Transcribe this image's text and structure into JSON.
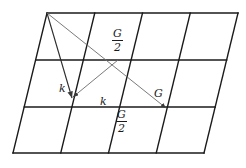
{
  "figure": {
    "background_color": "#ffffff",
    "width": 246,
    "height": 168
  },
  "lattice": {
    "description": "4 by 3 oblique lattice drawn as a large parallelogram subdivided by grid lines",
    "columns": 4,
    "rows": 3,
    "line_color": "#1a1a1a",
    "line_width": 1.4,
    "corners": {
      "top_left": [
        47,
        13
      ],
      "top_right": [
        238,
        13
      ],
      "bottom_right": [
        204,
        153
      ],
      "bottom_left": [
        13,
        153
      ]
    },
    "horizontal_lines_y": [
      13,
      60,
      107,
      153
    ],
    "slant_dx_per_row": -11.33
  },
  "vectors": {
    "color": "#6b6b6b",
    "line_width": 0.9,
    "items": [
      {
        "name": "k-left",
        "label": "k",
        "from": [
          47,
          13
        ],
        "to": [
          72,
          98
        ],
        "arrowhead": true
      },
      {
        "name": "k-right",
        "label": "k",
        "from": [
          118,
          60
        ],
        "to": [
          72,
          98
        ],
        "arrowhead": true
      },
      {
        "name": "G",
        "label": "G",
        "from": [
          47,
          13
        ],
        "to": [
          166,
          108
        ],
        "arrowhead": true
      }
    ]
  },
  "labels": {
    "g_over_2_top": {
      "numerator": "G",
      "denominator": "2",
      "x": 112,
      "y": 28
    },
    "g_over_2_bottom": {
      "numerator": "G",
      "denominator": "2",
      "x": 116,
      "y": 109
    },
    "k_left": {
      "text": "k",
      "x": 59,
      "y": 83
    },
    "k_right": {
      "text": "k",
      "x": 100,
      "y": 96
    },
    "g_right": {
      "text": "G",
      "x": 154,
      "y": 88
    }
  }
}
